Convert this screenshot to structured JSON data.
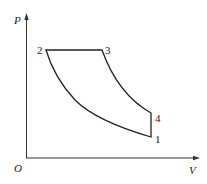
{
  "diagram": {
    "type": "P-V diagram (thermodynamic cycle)",
    "axes": {
      "y_label": "P",
      "x_label": "V",
      "origin_label": "O"
    },
    "points": [
      {
        "id": "1",
        "label": "1"
      },
      {
        "id": "2",
        "label": "2"
      },
      {
        "id": "3",
        "label": "3"
      },
      {
        "id": "4",
        "label": "4"
      }
    ],
    "processes": [
      {
        "from": "1",
        "to": "2",
        "shape": "curve (compression)"
      },
      {
        "from": "2",
        "to": "3",
        "shape": "horizontal line (constant pressure)"
      },
      {
        "from": "3",
        "to": "4",
        "shape": "curve (expansion)"
      },
      {
        "from": "4",
        "to": "1",
        "shape": "vertical line (constant volume)"
      }
    ],
    "colors": {
      "line": "#222222",
      "background": "#ffffff"
    }
  }
}
